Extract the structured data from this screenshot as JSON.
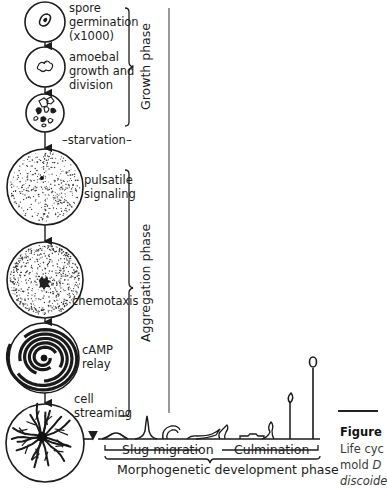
{
  "stages": [
    {
      "id": "spore-germination",
      "label_lines": [
        "spore",
        "germination",
        "(x1000)"
      ]
    },
    {
      "id": "amoebal-growth",
      "label_lines": [
        "amoebal",
        "growth and",
        "division"
      ]
    },
    {
      "id": "dividing-cells",
      "label_lines": []
    },
    {
      "id": "pulsatile-signaling",
      "label_lines": [
        "pulsatile",
        "signaling"
      ]
    },
    {
      "id": "chemotaxis",
      "label_lines": [
        "chemotaxis"
      ]
    },
    {
      "id": "camp-relay",
      "label_lines": [
        "cAMP",
        "relay"
      ]
    },
    {
      "id": "cell-streaming",
      "label_lines": [
        "cell",
        "streaming"
      ]
    }
  ],
  "labels": {
    "spore_1": "spore",
    "spore_2": "germination",
    "spore_3": "(x1000)",
    "amoebal_1": "amoebal",
    "amoebal_2": "growth and",
    "amoebal_3": "division",
    "starvation": "–starvation–",
    "pulsatile_1": "pulsatile",
    "pulsatile_2": "signaling",
    "chemotaxis": "chemotaxis",
    "camp_1": "cAMP",
    "camp_2": "relay",
    "cell_1": "cell",
    "cell_2": "streaming"
  },
  "phases": {
    "growth": "Growth phase",
    "aggregation": "Aggregation phase",
    "slug": "Slug migration",
    "culmination": "Culmination",
    "morphogenetic": "Morphogenetic development phase"
  },
  "caption": {
    "title": "Figure",
    "line1": "Life cyc",
    "line2_prefix": "mold ",
    "line2_italic": "D",
    "line3": "discoide"
  }
}
